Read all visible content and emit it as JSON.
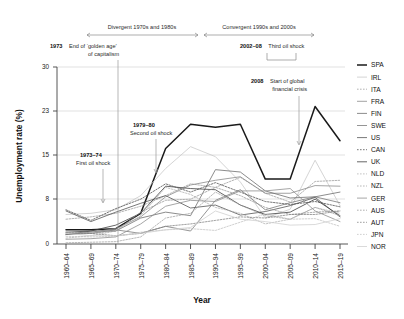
{
  "chart_data": {
    "type": "line",
    "title": "",
    "xlabel": "Year",
    "ylabel": "Unemployment rate (%)",
    "categories": [
      "1960–64",
      "1965–69",
      "1970–74",
      "1975–79",
      "1980–84",
      "1985–89",
      "1990–94",
      "1995–99",
      "2000–04",
      "2005–09",
      "2010–14",
      "2015–19"
    ],
    "ylim": [
      0,
      30
    ],
    "yticks": [
      0,
      8,
      15,
      23,
      30
    ],
    "grid": "horizontal",
    "legend_position": "right",
    "series": [
      {
        "name": "SPA",
        "style": "solid-thick",
        "color": "#1a1a1a",
        "values": [
          2.4,
          2.4,
          2.6,
          5.2,
          16.2,
          20.3,
          19.8,
          20.3,
          11.0,
          11.0,
          23.3,
          17.5
        ]
      },
      {
        "name": "IRL",
        "style": "solid",
        "color": "#c9c9c9",
        "values": [
          5.0,
          5.2,
          5.8,
          8.2,
          12.8,
          16.5,
          14.8,
          10.5,
          4.4,
          5.9,
          14.2,
          6.5
        ]
      },
      {
        "name": "ITA",
        "style": "dotted",
        "color": "#9a9a9a",
        "values": [
          4.2,
          4.6,
          5.2,
          6.4,
          8.2,
          10.2,
          9.6,
          11.3,
          8.6,
          7.1,
          10.6,
          10.8
        ]
      },
      {
        "name": "FRA",
        "style": "solid",
        "color": "#8c8c8c",
        "values": [
          1.6,
          2.0,
          2.6,
          4.6,
          8.0,
          10.0,
          10.8,
          11.4,
          8.6,
          8.6,
          9.9,
          9.8
        ]
      },
      {
        "name": "FIN",
        "style": "solid",
        "color": "#6e6e6e",
        "values": [
          1.6,
          2.2,
          2.2,
          4.4,
          5.4,
          4.8,
          12.6,
          12.2,
          9.0,
          7.8,
          8.0,
          8.8
        ]
      },
      {
        "name": "SWE",
        "style": "solid",
        "color": "#7a7a7a",
        "values": [
          1.6,
          1.8,
          2.4,
          1.8,
          3.0,
          2.2,
          7.4,
          9.2,
          5.8,
          7.0,
          8.0,
          7.0
        ]
      },
      {
        "name": "US",
        "style": "solid",
        "color": "#555555",
        "values": [
          5.6,
          3.8,
          5.4,
          6.9,
          8.2,
          6.1,
          6.6,
          4.9,
          5.5,
          6.5,
          7.9,
          4.6
        ]
      },
      {
        "name": "CAN",
        "style": "dotted",
        "color": "#4a4a4a",
        "values": [
          5.8,
          4.0,
          6.0,
          7.6,
          10.2,
          8.8,
          10.4,
          8.8,
          7.2,
          6.7,
          7.2,
          6.3
        ]
      },
      {
        "name": "UK",
        "style": "solid",
        "color": "#3f3f3f",
        "values": [
          2.0,
          2.2,
          3.2,
          5.2,
          9.8,
          9.4,
          9.2,
          6.6,
          5.0,
          5.4,
          7.6,
          4.8
        ]
      },
      {
        "name": "NLD",
        "style": "dotted",
        "color": "#b0b0b0",
        "values": [
          1.0,
          1.4,
          2.2,
          4.8,
          9.6,
          8.4,
          6.2,
          5.2,
          3.4,
          4.2,
          6.2,
          5.2
        ]
      },
      {
        "name": "NZL",
        "style": "dotted",
        "color": "#a0a0a0",
        "values": [
          0.2,
          0.3,
          0.4,
          1.2,
          4.4,
          5.2,
          8.8,
          6.6,
          4.8,
          4.2,
          6.2,
          4.8
        ]
      },
      {
        "name": "GER",
        "style": "solid",
        "color": "#8f8f8f",
        "values": [
          0.8,
          0.9,
          1.2,
          3.4,
          6.4,
          7.4,
          7.2,
          9.0,
          9.0,
          9.4,
          5.6,
          3.8
        ]
      },
      {
        "name": "AUS",
        "style": "dotted",
        "color": "#959595",
        "values": [
          2.0,
          1.8,
          2.2,
          5.4,
          7.4,
          7.6,
          9.6,
          8.2,
          6.2,
          5.0,
          5.4,
          5.6
        ]
      },
      {
        "name": "AUT",
        "style": "dotted",
        "color": "#7f7f7f",
        "values": [
          1.8,
          1.8,
          1.4,
          1.8,
          3.0,
          3.4,
          4.0,
          4.6,
          4.4,
          5.0,
          5.0,
          5.6
        ]
      },
      {
        "name": "JPN",
        "style": "dotted",
        "color": "#c0c0c0",
        "values": [
          1.3,
          1.2,
          1.3,
          2.0,
          2.4,
          2.6,
          2.3,
          3.7,
          5.1,
          4.2,
          4.3,
          3.0
        ]
      },
      {
        "name": "NOR",
        "style": "solid",
        "color": "#d0d0d0",
        "values": [
          1.8,
          1.4,
          1.4,
          1.8,
          2.4,
          2.8,
          5.6,
          4.2,
          3.8,
          3.2,
          3.3,
          4.3
        ]
      }
    ],
    "annotations": [
      {
        "id": "divergent",
        "text": "Divergent 1970s and 1980s",
        "kind": "span-label"
      },
      {
        "id": "convergent",
        "text": "Convergent 1990s and 2000s",
        "kind": "span-label"
      },
      {
        "id": "golden-age",
        "bold": "1973",
        "text": "End of ‘golden age’",
        "text2": "of capitalism",
        "kind": "callout"
      },
      {
        "id": "third-oil-shock",
        "bold": "2002–08",
        "text": "Third oil shock",
        "kind": "bracket-label"
      },
      {
        "id": "gfc",
        "bold": "2008",
        "text": "Start of global",
        "text2": "financial crisis",
        "kind": "callout"
      },
      {
        "id": "second-oil-shock",
        "bold": "1979–80",
        "text": "Second oil shock",
        "kind": "callout"
      },
      {
        "id": "first-oil-shock",
        "bold": "1973–74",
        "text": "First oil shock",
        "kind": "callout"
      }
    ]
  },
  "axes": {
    "y_title": "Unemployment rate (%)",
    "x_title": "Year",
    "y_tick_labels": [
      "30",
      "23",
      "15",
      "8",
      "0"
    ],
    "x_tick_labels": [
      "1960–64",
      "1965–69",
      "1970–74",
      "1975–79",
      "1980–84",
      "1985–89",
      "1990–94",
      "1995–99",
      "2000–04",
      "2005–09",
      "2010–14",
      "2015–19"
    ]
  },
  "legend": {
    "items": [
      {
        "label": "SPA"
      },
      {
        "label": "IRL"
      },
      {
        "label": "ITA"
      },
      {
        "label": "FRA"
      },
      {
        "label": "FIN"
      },
      {
        "label": "SWE"
      },
      {
        "label": "US"
      },
      {
        "label": "CAN"
      },
      {
        "label": "UK"
      },
      {
        "label": "NLD"
      },
      {
        "label": "NZL"
      },
      {
        "label": "GER"
      },
      {
        "label": "AUS"
      },
      {
        "label": "AUT"
      },
      {
        "label": "JPN"
      },
      {
        "label": "NOR"
      }
    ]
  },
  "annotations_text": {
    "divergent": "Divergent 1970s and 1980s",
    "convergent": "Convergent 1990s and 2000s",
    "golden_bold": "1973",
    "golden_line1": "End of ‘golden age’",
    "golden_line2": "of capitalism",
    "third_bold": "2002–08",
    "third_rest": "Third oil shock",
    "gfc_bold": "2008",
    "gfc_line1": "Start of global",
    "gfc_line2": "financial crisis",
    "second_bold": "1979–80",
    "second_rest": "Second oil shock",
    "first_bold": "1973–74",
    "first_rest": "First oil shock"
  }
}
